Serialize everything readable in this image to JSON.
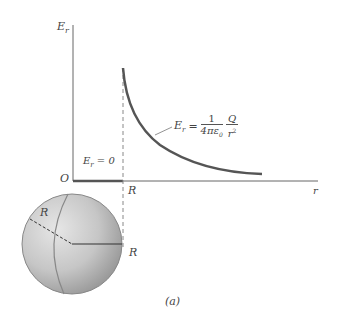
{
  "figure": {
    "y_axis_label": "E",
    "y_axis_sub": "r",
    "x_axis_label": "r",
    "origin_label": "O",
    "inside_label": "E",
    "inside_sub": "r",
    "inside_value": "= 0",
    "radius_tick_label": "R",
    "formula": {
      "lhs": "E",
      "lhs_sub": "r",
      "eq": "=",
      "num1": "1",
      "den1": "4πε",
      "den1_sub": "0",
      "num2": "Q",
      "den2": "r",
      "den2_sup": "2"
    },
    "sphere_radius_label_left": "R",
    "sphere_radius_label_right": "R",
    "caption": "(a)"
  },
  "colors": {
    "axis": "#555555",
    "curve": "#555555",
    "sphere_light": "#d9d9d9",
    "sphere_dark": "#9a9a9a"
  }
}
